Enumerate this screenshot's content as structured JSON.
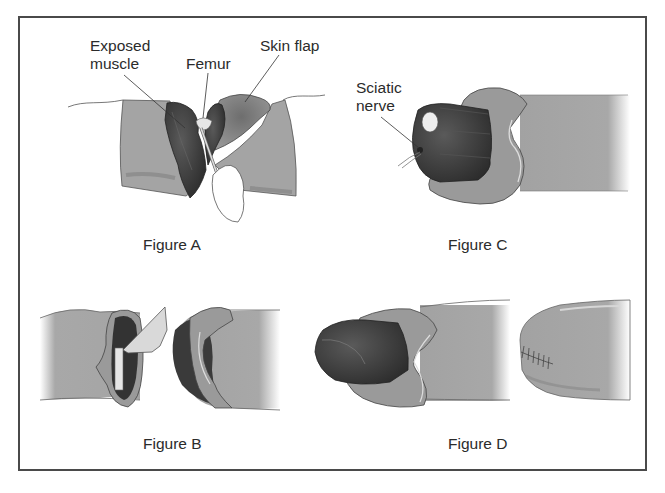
{
  "figure": {
    "panels": [
      {
        "id": "A",
        "caption": "Figure A",
        "labels": [
          {
            "line1": "Exposed",
            "line2": "muscle"
          },
          {
            "line1": "Femur"
          },
          {
            "line1": "Skin flap"
          }
        ]
      },
      {
        "id": "B",
        "caption": "Figure B"
      },
      {
        "id": "C",
        "caption": "Figure C",
        "labels": [
          {
            "line1": "Sciatic",
            "line2": "nerve"
          }
        ]
      },
      {
        "id": "D",
        "caption": "Figure D"
      }
    ],
    "colors": {
      "skin": "#a4a4a4",
      "skin_flap": "#8e8e8e",
      "muscle": "#3c3c3c",
      "bone": "#e6e6e6",
      "border": "#4a4a4a"
    }
  }
}
